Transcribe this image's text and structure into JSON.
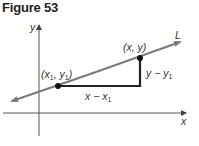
{
  "figure": {
    "title": "Figure 53"
  },
  "axes": {
    "x_label": "x",
    "y_label": "y",
    "origin": [
      39,
      113
    ]
  },
  "line": {
    "label": "L",
    "start": [
      12,
      101
    ],
    "end": [
      180,
      42
    ],
    "color": "#7a7a7a"
  },
  "points": [
    {
      "label_main": "(x",
      "sub1": "1",
      "mid": ", y",
      "sub2": "1",
      "close": ")",
      "pos": [
        58,
        86
      ]
    },
    {
      "label": "(x, y)",
      "pos": [
        140,
        58
      ]
    }
  ],
  "triangle": {
    "horizontal_label_main": "x − x",
    "horizontal_label_sub": "1",
    "vertical_label_main": "y − y",
    "vertical_label_sub": "1",
    "color": "#222222"
  },
  "colors": {
    "axis": "#555555",
    "line": "#7a7a7a",
    "triangle": "#222222",
    "point": "#111111"
  }
}
